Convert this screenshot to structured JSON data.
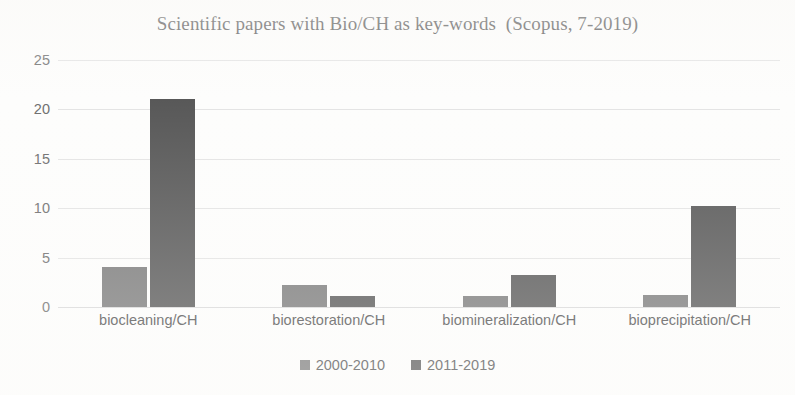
{
  "chart_data": {
    "type": "bar",
    "title": "Scientific papers with Bio/CH as key-words  (Scopus, 7-2019)",
    "xlabel": "",
    "ylabel": "",
    "categories": [
      "biocleaning/CH",
      "biorestoration/CH",
      "biomineralization/CH",
      "bioprecipitation/CH"
    ],
    "series": [
      {
        "name": "2000-2010",
        "color": "#7b7b7b",
        "values": [
          4.1,
          2.2,
          1.1,
          1.2
        ]
      },
      {
        "name": "2011-2019",
        "color": "#585858",
        "values": [
          21.1,
          1.1,
          3.2,
          10.2
        ]
      }
    ],
    "ylim": [
      0,
      25
    ],
    "yticks": [
      0,
      5,
      10,
      15,
      20,
      25
    ],
    "ytick_labels": [
      "0",
      "5",
      "10",
      "15",
      "20",
      "25"
    ],
    "grid": true,
    "grid_axis": "y",
    "legend_position": "bottom"
  },
  "legend": {
    "items": [
      {
        "label": "2000-2010",
        "swatch": "legend-swatch-2000-2010"
      },
      {
        "label": "2011-2019",
        "swatch": "legend-swatch-2011-2019"
      }
    ]
  },
  "colors": {
    "series_light": "#7b7b7b",
    "series_dark": "#585858",
    "gridline": "#e4e4e4",
    "axis_text": "#6f6f6f",
    "title_text": "#4a4a4a",
    "background": "#fdfdfc"
  }
}
